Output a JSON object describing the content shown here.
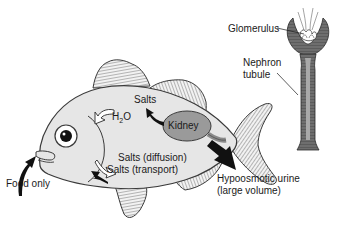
{
  "diagram": {
    "colors": {
      "body_fill": "#e8e8e8",
      "outline": "#3a3a3a",
      "kidney_fill": "#9a9a9a",
      "arrow_dark": "#111111",
      "arrow_light": "#ffffff",
      "nephron_fill": "#7a7a7a",
      "nephron_lumen": "#b0b0b0"
    },
    "labels": {
      "salts_in": "Salts",
      "water": "H",
      "water_sub": "2",
      "water_tail": "O",
      "kidney": "Kidney",
      "salts_diffusion": "Salts (diffusion)",
      "salts_transport": "Salts (transport)",
      "food": "Food only",
      "urine_line1": "Hypoosmotic urine",
      "urine_line2": "(large volume)",
      "glomerulus": "Glomerulus",
      "nephron_line1": "Nephron",
      "nephron_line2": "tubule"
    },
    "arrows": [
      {
        "name": "water-in-arrow",
        "style": "outline",
        "direction": "into body"
      },
      {
        "name": "salts-reabsorbed-arrow",
        "style": "solid",
        "direction": "kidney to body"
      },
      {
        "name": "salts-diffusion-arrow",
        "style": "outline",
        "direction": "out of gills"
      },
      {
        "name": "salts-transport-arrow",
        "style": "solid",
        "direction": "into gills"
      },
      {
        "name": "food-arrow",
        "style": "solid",
        "direction": "into mouth"
      },
      {
        "name": "urine-arrow",
        "style": "solid",
        "direction": "out of body"
      }
    ]
  }
}
